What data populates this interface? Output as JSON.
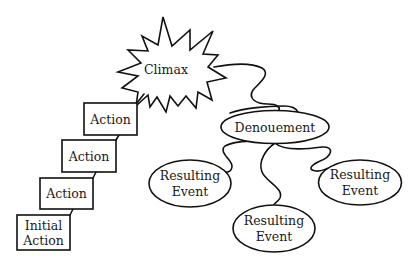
{
  "diagram": {
    "climax": {
      "label": "Climax",
      "shape": "starburst"
    },
    "actions": [
      {
        "lines": [
          "Action"
        ]
      },
      {
        "lines": [
          "Action"
        ]
      },
      {
        "lines": [
          "Action"
        ]
      },
      {
        "lines": [
          "Initial",
          "Action"
        ]
      }
    ],
    "denouement": {
      "label": "Denouement",
      "shape": "ellipse"
    },
    "resulting_events": [
      {
        "lines": [
          "Resulting",
          "Event"
        ],
        "position": "left"
      },
      {
        "lines": [
          "Resulting",
          "Event"
        ],
        "position": "bottom"
      },
      {
        "lines": [
          "Resulting",
          "Event"
        ],
        "position": "right"
      }
    ],
    "colors": {
      "stroke": "#111111",
      "background": "#ffffff",
      "text": "#1a1a1a"
    }
  }
}
